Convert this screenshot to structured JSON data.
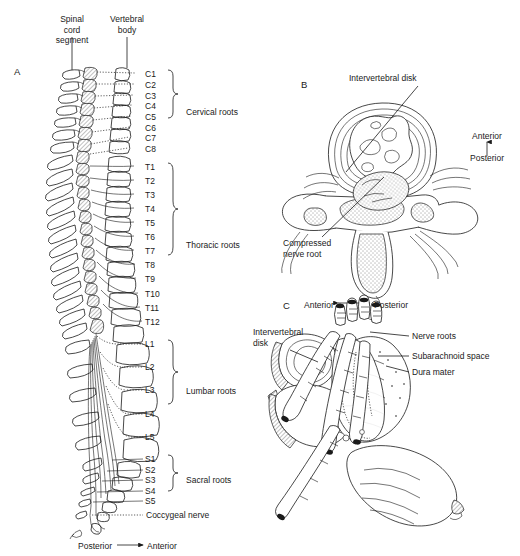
{
  "figure": {
    "panels": [
      {
        "letter": "A",
        "x": 14,
        "y": 66
      },
      {
        "letter": "B",
        "x": 301,
        "y": 79
      },
      {
        "letter": "C",
        "x": 283,
        "y": 300
      }
    ]
  },
  "panel_a": {
    "callouts": [
      {
        "text": "Spinal\ncord\nsegment",
        "x": 46,
        "y": 14,
        "w": 52,
        "align": "center"
      },
      {
        "text": "Vertebral\nbody",
        "x": 101,
        "y": 14,
        "w": 52,
        "align": "center"
      }
    ],
    "levels": [
      {
        "id": "C1",
        "y": 74
      },
      {
        "id": "C2",
        "y": 85
      },
      {
        "id": "C3",
        "y": 96
      },
      {
        "id": "C4",
        "y": 106
      },
      {
        "id": "C5",
        "y": 117
      },
      {
        "id": "C6",
        "y": 128
      },
      {
        "id": "C7",
        "y": 138
      },
      {
        "id": "C8",
        "y": 149
      },
      {
        "id": "T1",
        "y": 167
      },
      {
        "id": "T2",
        "y": 181
      },
      {
        "id": "T3",
        "y": 195
      },
      {
        "id": "T4",
        "y": 209
      },
      {
        "id": "T5",
        "y": 223
      },
      {
        "id": "T6",
        "y": 237
      },
      {
        "id": "T7",
        "y": 251
      },
      {
        "id": "T8",
        "y": 265
      },
      {
        "id": "T9",
        "y": 279
      },
      {
        "id": "T10",
        "y": 294
      },
      {
        "id": "T11",
        "y": 308
      },
      {
        "id": "T12",
        "y": 322
      },
      {
        "id": "L1",
        "y": 344
      },
      {
        "id": "L2",
        "y": 367
      },
      {
        "id": "L3",
        "y": 390
      },
      {
        "id": "L4",
        "y": 414
      },
      {
        "id": "L5",
        "y": 437
      },
      {
        "id": "S1",
        "y": 459
      },
      {
        "id": "S2",
        "y": 470
      },
      {
        "id": "S3",
        "y": 480
      },
      {
        "id": "S4",
        "y": 491
      },
      {
        "id": "S5",
        "y": 501
      }
    ],
    "groups": [
      {
        "name": "Cervical roots",
        "top": 70,
        "bottom": 153,
        "label_y": 112
      },
      {
        "name": "Thoracic roots",
        "top": 163,
        "bottom": 326,
        "label_y": 245
      },
      {
        "name": "Lumbar roots",
        "top": 340,
        "bottom": 441,
        "label_y": 391
      },
      {
        "name": "Sacral roots",
        "top": 455,
        "bottom": 505,
        "label_y": 480
      }
    ],
    "coccygeal_label": "Coccygeal nerve",
    "coccygeal_y": 515,
    "orientation": {
      "left": "Posterior",
      "right": "Anterior",
      "y": 546
    }
  },
  "panel_b": {
    "labels": [
      {
        "text": "Intervertebral disk",
        "x": 349,
        "y": 78
      },
      {
        "text": "Compressed\nnerve root",
        "x": 283,
        "y": 243
      }
    ],
    "orientation": {
      "top": "Anterior",
      "bottom": "Posterior",
      "x": 487,
      "y_top": 136,
      "y_bottom": 158
    }
  },
  "panel_c": {
    "orientation": {
      "left": "Anterior",
      "right": "Posterior",
      "y": 305
    },
    "labels": [
      {
        "text": "Intervertebral\ndisk",
        "x": 253,
        "y": 330,
        "align": "left"
      },
      {
        "text": "Nerve roots",
        "x": 412,
        "y": 332,
        "align": "left"
      },
      {
        "text": "Subarachnoid space",
        "x": 412,
        "y": 353,
        "align": "left"
      },
      {
        "text": "Dura mater",
        "x": 412,
        "y": 369,
        "align": "left"
      }
    ]
  },
  "colors": {
    "ink": "#1a1a1a",
    "paper": "#ffffff"
  }
}
